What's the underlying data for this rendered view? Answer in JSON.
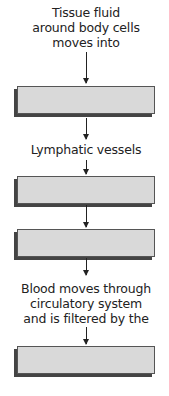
{
  "diagram": {
    "type": "flowchart",
    "steps": [
      {
        "label": "Tissue fluid around body cells moves into",
        "lines": [
          "Tissue fluid",
          "around body cells",
          "moves into"
        ]
      },
      {
        "box": "blank_1"
      },
      {
        "label": "Lymphatic vessels",
        "lines": [
          "Lymphatic vessels"
        ]
      },
      {
        "box": "blank_2"
      },
      {
        "box": "blank_3"
      },
      {
        "label": "Blood moves through circulatory system and is filtered by the",
        "lines": [
          "Blood moves through",
          "circulatory system",
          "and is filtered by the"
        ]
      },
      {
        "box": "blank_4"
      }
    ],
    "box_fill": "#d9d9d9",
    "box_border": "#555555"
  }
}
